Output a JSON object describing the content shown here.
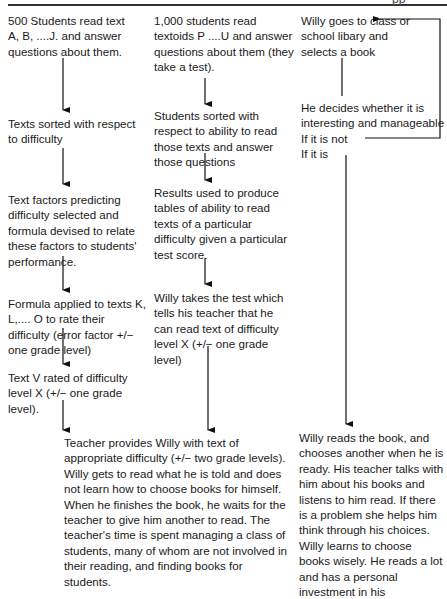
{
  "header": {
    "cropped_text": "pp"
  },
  "column_1": {
    "steps": [
      "500 Students read text A, B, ....J. and answer questions about them.",
      "Texts sorted with respect to difficulty",
      "Text factors predicting difficulty selected and formula devised to relate these factors to students' performance.",
      "Formula applied to texts K, L,.... O to rate their difficulty (error factor +/− one grade level)",
      "Text V rated of difficulty level X (+/− one grade level)."
    ]
  },
  "column_2": {
    "steps": [
      "1,000 students read textoids P ....U and answer questions about them (they take a test).",
      "Students sorted with respect to ability to read those texts and answer those questions",
      "Results used to produce tables of ability to read texts of a particular difficulty given a particular test score.",
      "Willy takes the test which tells his teacher that he can read text of difficulty level X (+/− one grade level)"
    ]
  },
  "column_3": {
    "steps": [
      "Willy goes to class or school libary and selects a book",
      "He decides whether it is interesting and manageable"
    ],
    "branch_not": "If it is not",
    "branch_is": "If it is"
  },
  "outcomes": {
    "teacher_provides": "Teacher provides Willy with text of appropriate difficulty (+/− two grade levels). Willy gets to read what he is told and does not learn how to choose books for himself. When he finishes the book, he waits for the teacher to give him another to read. The teacher's time is spent managing a class of students, many of whom are not involved in their reading, and finding books for students.",
    "willy_reads": "Willy reads the book, and chooses another when he is ready. His teacher talks with him about his books and listens to him read. If there is a problem she helps him think through his choices. Willy learns to choose books wisely. He reads a lot and has a personal investment in his"
  }
}
